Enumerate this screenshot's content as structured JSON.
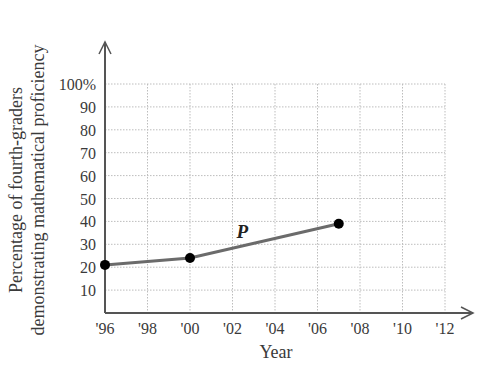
{
  "chart_data": {
    "type": "line",
    "title": "",
    "xlabel": "Year",
    "ylabel_lines": [
      "Percentage of fourth-graders",
      "demonstrating mathematical proficiency"
    ],
    "ylabel": "Percentage of fourth-graders demonstrating mathematical proficiency",
    "x_tick_labels": [
      "'96",
      "'98",
      "'00",
      "'02",
      "'04",
      "'06",
      "'08",
      "'10",
      "'12"
    ],
    "x_tick_values": [
      1996,
      1998,
      2000,
      2002,
      2004,
      2006,
      2008,
      2010,
      2012
    ],
    "y_tick_labels": [
      "10",
      "20",
      "30",
      "40",
      "50",
      "60",
      "70",
      "80",
      "90",
      "100%"
    ],
    "y_tick_values": [
      10,
      20,
      30,
      40,
      50,
      60,
      70,
      80,
      90,
      100
    ],
    "xlim": [
      1996,
      2012
    ],
    "ylim": [
      0,
      100
    ],
    "grid": true,
    "series": [
      {
        "name": "P",
        "x": [
          1996,
          2000,
          2007
        ],
        "values": [
          21,
          24,
          39
        ],
        "color": "#6b6b6b",
        "marker_color": "#000000"
      }
    ],
    "annotations": [
      {
        "text": "P",
        "x": 2003.5,
        "y": 34
      }
    ],
    "legend": null
  }
}
